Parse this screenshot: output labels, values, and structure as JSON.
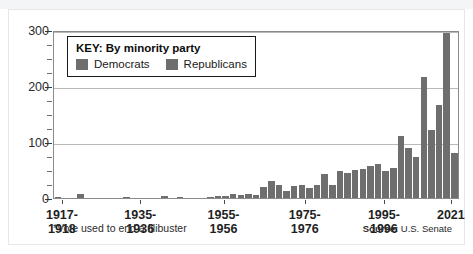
{
  "figure": {
    "footnote": "*Vote used to end a filibuster",
    "source_label": "Source:",
    "source_value": "U.S. Senate"
  },
  "legend": {
    "title": "KEY: By minority party",
    "items": [
      {
        "label": "Democrats",
        "color": "#6e6e6e"
      },
      {
        "label": "Republicans",
        "color": "#6e6e6e"
      }
    ]
  },
  "chart_data": {
    "type": "bar",
    "title": "",
    "subtitle": "",
    "xlabel": "",
    "ylabel": "",
    "ylim": [
      0,
      300
    ],
    "yticks": [
      0,
      100,
      200,
      300
    ],
    "ytick_labels": [
      "0",
      "100",
      "200",
      "300"
    ],
    "yminor_step": 25,
    "grid": true,
    "grid_axis": "y",
    "legend_position": "inside-top-left",
    "bar_color": "#6e6e6e",
    "xtick_labels": [
      "1917-\n1918",
      "1935-\n1936",
      "1955-\n1956",
      "1975-\n1976",
      "1995-\n1996",
      "2021"
    ],
    "xtick_positions_pct": [
      2.2,
      21.5,
      42.0,
      62.0,
      81.5,
      98.0
    ],
    "categories": [
      "1917-1918",
      "1919-1920",
      "1921-1922",
      "1923-1924",
      "1925-1926",
      "1927-1928",
      "1929-1930",
      "1931-1932",
      "1933-1934",
      "1935-1936",
      "1937-1938",
      "1939-1940",
      "1941-1942",
      "1943-1944",
      "1945-1946",
      "1947-1948",
      "1949-1950",
      "1951-1952",
      "1953-1954",
      "1955-1956",
      "1957-1958",
      "1959-1960",
      "1961-1962",
      "1963-1964",
      "1965-1966",
      "1967-1968",
      "1969-1970",
      "1971-1972",
      "1973-1974",
      "1975-1976",
      "1977-1978",
      "1979-1980",
      "1981-1982",
      "1983-1984",
      "1985-1986",
      "1987-1988",
      "1989-1990",
      "1991-1992",
      "1993-1994",
      "1995-1996",
      "1997-1998",
      "1999-2000",
      "2001-2002",
      "2003-2004",
      "2005-2006",
      "2007-2008",
      "2009-2010",
      "2011-2012",
      "2013-2014",
      "2015-2016",
      "2017-2018",
      "2019-2020",
      "2021"
    ],
    "values": [
      1,
      0,
      0,
      7,
      0,
      0,
      0,
      0,
      0,
      1,
      0,
      0,
      0,
      0,
      3,
      0,
      1,
      0,
      0,
      0,
      2,
      3,
      4,
      7,
      6,
      7,
      6,
      20,
      31,
      23,
      13,
      22,
      23,
      19,
      23,
      43,
      24,
      48,
      46,
      50,
      53,
      58,
      61,
      49,
      54,
      112,
      91,
      75,
      218,
      123,
      168,
      298,
      82
    ],
    "value_max": 298,
    "value_max_category": "2019-2020"
  }
}
